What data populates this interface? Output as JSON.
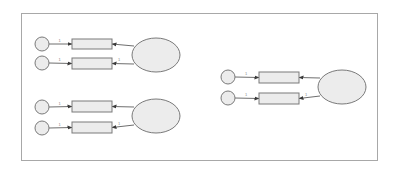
{
  "diagram": {
    "type": "path-model",
    "colors": {
      "frame_border": "#a8a8a8",
      "shape_fill": "#ececec",
      "shape_stroke": "#7a7a7a",
      "path_stroke": "#6e6e6e",
      "label": "#888888"
    },
    "groups": [
      {
        "name": "group-top-left",
        "error_terms": [
          {
            "cx": 42,
            "cy": 44
          },
          {
            "cx": 42,
            "cy": 63
          }
        ],
        "indicators": [
          {
            "x": 72,
            "y": 39,
            "w": 40,
            "h": 10
          },
          {
            "x": 72,
            "y": 58,
            "w": 40,
            "h": 11
          }
        ],
        "latent": {
          "cx": 156,
          "cy": 55,
          "rx": 24,
          "ry": 17
        },
        "error_path_labels": [
          "1",
          "1"
        ],
        "loading_labels": [
          "",
          "1"
        ]
      },
      {
        "name": "group-bottom-left",
        "error_terms": [
          {
            "cx": 42,
            "cy": 107
          },
          {
            "cx": 42,
            "cy": 128
          }
        ],
        "indicators": [
          {
            "x": 72,
            "y": 101,
            "w": 40,
            "h": 11
          },
          {
            "x": 72,
            "y": 122,
            "w": 40,
            "h": 11
          }
        ],
        "latent": {
          "cx": 156,
          "cy": 116,
          "rx": 24,
          "ry": 17
        },
        "error_path_labels": [
          "1",
          "1"
        ],
        "loading_labels": [
          "",
          "1"
        ]
      },
      {
        "name": "group-right",
        "error_terms": [
          {
            "cx": 228,
            "cy": 77
          },
          {
            "cx": 228,
            "cy": 98
          }
        ],
        "indicators": [
          {
            "x": 259,
            "y": 72,
            "w": 40,
            "h": 11
          },
          {
            "x": 259,
            "y": 93,
            "w": 40,
            "h": 11
          }
        ],
        "latent": {
          "cx": 342,
          "cy": 87,
          "rx": 24,
          "ry": 17
        },
        "error_path_labels": [
          "1",
          "1"
        ],
        "loading_labels": [
          "",
          "1"
        ]
      }
    ]
  }
}
